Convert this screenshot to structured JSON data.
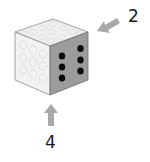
{
  "figure": {
    "labels": {
      "right_arrow_label": "2",
      "bottom_arrow_label": "4"
    },
    "die": {
      "top_face": {
        "pips_visible": "ghosted",
        "fill": "#f0f0f0"
      },
      "front_face": {
        "pips_visible": "ghosted",
        "pip_count": 9,
        "fill": "#f2f2f2"
      },
      "right_face": {
        "pips_visible": "solid",
        "pip_count": 6,
        "fill": "#9c9c9c",
        "pip_color": "#0a0a0a"
      }
    },
    "arrows": [
      {
        "name": "arrow-from-right",
        "direction": "down-left",
        "color": "#a8a8a8",
        "label": "2"
      },
      {
        "name": "arrow-from-below",
        "direction": "up",
        "color": "#a8a8a8",
        "label": "4"
      }
    ]
  }
}
